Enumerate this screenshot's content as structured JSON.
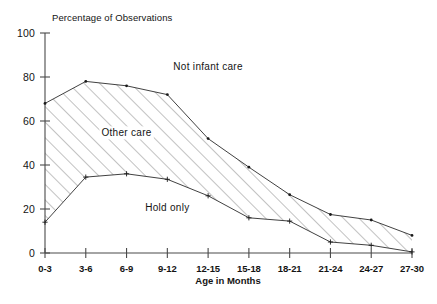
{
  "chart_data": {
    "type": "area",
    "title": "Percentage of Observations",
    "xlabel": "Age in Months",
    "ylabel": "Percentage of Observations",
    "categories": [
      "0-3",
      "3-6",
      "6-9",
      "9-12",
      "12-15",
      "15-18",
      "18-21",
      "21-24",
      "24-27",
      "27-30"
    ],
    "ylim": [
      0,
      100
    ],
    "yticks": [
      0,
      20,
      40,
      60,
      80,
      100
    ],
    "ytick_labels": [
      "0",
      "20",
      "40",
      "60",
      "80",
      "100"
    ],
    "grid": false,
    "legend_position": "inline-annotations",
    "series": [
      {
        "name": "Infant care total (upper boundary)",
        "values": [
          68,
          78,
          76,
          72,
          52,
          39,
          26.5,
          17.5,
          15,
          8
        ]
      },
      {
        "name": "Hold only (lower boundary)",
        "values": [
          14,
          34.5,
          36,
          33.5,
          26,
          16,
          14.5,
          5,
          3.5,
          0.5
        ]
      }
    ],
    "annotations": [
      {
        "text": "Not infant care",
        "x_category": "12-15",
        "y_value": 83
      },
      {
        "text": "Other care",
        "x_category": "6-9",
        "y_value": 53
      },
      {
        "text": "Hold only",
        "x_category": "9-12",
        "y_value": 19
      }
    ],
    "band_fill": "diagonal-hatch",
    "hatch_color": "#6f6f6f",
    "line_color": "#2b2b2b",
    "axis_color": "#4a4a4a"
  },
  "axis": {
    "y_title": "Percentage of Observations",
    "x_title": "Age in Months"
  }
}
